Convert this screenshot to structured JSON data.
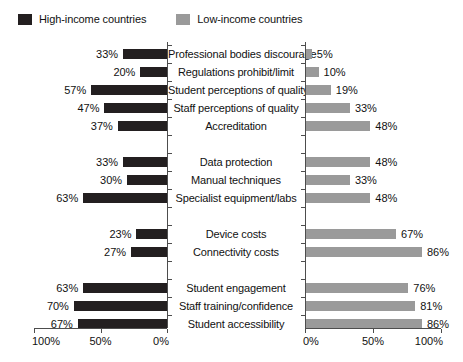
{
  "legend": {
    "entries": [
      {
        "label": "High-income countries",
        "color": "#231f20",
        "swatch_name": "legend-swatch-high-income"
      },
      {
        "label": "Low-income countries",
        "color": "#9a9a9a",
        "swatch_name": "legend-swatch-low-income"
      }
    ]
  },
  "axes": {
    "left": {
      "ticks": [
        "100%",
        "50%",
        "0%"
      ],
      "tick_values": [
        100,
        50,
        0
      ],
      "range_max": 100
    },
    "right": {
      "ticks": [
        "0%",
        "50%",
        "100%"
      ],
      "tick_values": [
        0,
        50,
        100
      ],
      "range_max": 100
    }
  },
  "chart_data": {
    "type": "bar",
    "orientation": "horizontal-diverging",
    "title": "",
    "xlabel": "",
    "ylabel": "",
    "xlim": [
      0,
      100
    ],
    "grid": false,
    "legend_position": "top-left",
    "series": [
      {
        "name": "High-income countries",
        "color": "#231f20",
        "side": "left",
        "values": [
          33,
          20,
          57,
          47,
          37,
          33,
          30,
          63,
          23,
          27,
          63,
          70,
          67
        ],
        "labels": [
          "33%",
          "20%",
          "57%",
          "47%",
          "37%",
          "33%",
          "30%",
          "63%",
          "23%",
          "27%",
          "63%",
          "70%",
          "67%"
        ]
      },
      {
        "name": "Low-income countries",
        "color": "#9a9a9a",
        "side": "right",
        "values": [
          5,
          10,
          19,
          33,
          48,
          48,
          33,
          48,
          67,
          86,
          76,
          81,
          86
        ],
        "labels": [
          "5%",
          "10%",
          "19%",
          "33%",
          "48%",
          "48%",
          "33%",
          "48%",
          "67%",
          "86%",
          "76%",
          "81%",
          "86%"
        ]
      }
    ],
    "categories": [
      "Professional bodies discourage",
      "Regulations prohibit/limit",
      "Student perceptions of quality",
      "Staff perceptions of quality",
      "Accreditation",
      "Data protection",
      "Manual techniques",
      "Specialist equipment/labs",
      "Device costs",
      "Connectivity costs",
      "Student engagement",
      "Staff training/confidence",
      "Student accessibility"
    ],
    "groups": [
      {
        "rows": [
          0,
          1,
          2,
          3,
          4
        ]
      },
      {
        "rows": [
          5,
          6,
          7
        ]
      },
      {
        "rows": [
          8,
          9
        ]
      },
      {
        "rows": [
          10,
          11,
          12
        ]
      }
    ]
  },
  "rows": [
    {
      "category": "Professional bodies discourage",
      "left_label": "33%",
      "left_value": 33,
      "right_label": "5%",
      "right_value": 5,
      "slot": 0
    },
    {
      "category": "Regulations prohibit/limit",
      "left_label": "20%",
      "left_value": 20,
      "right_label": "10%",
      "right_value": 10,
      "slot": 1
    },
    {
      "category": "Student perceptions of quality",
      "left_label": "57%",
      "left_value": 57,
      "right_label": "19%",
      "right_value": 19,
      "slot": 2
    },
    {
      "category": "Staff perceptions of quality",
      "left_label": "47%",
      "left_value": 47,
      "right_label": "33%",
      "right_value": 33,
      "slot": 3
    },
    {
      "category": "Accreditation",
      "left_label": "37%",
      "left_value": 37,
      "right_label": "48%",
      "right_value": 48,
      "slot": 4
    },
    {
      "category": "Data protection",
      "left_label": "33%",
      "left_value": 33,
      "right_label": "48%",
      "right_value": 48,
      "slot": 6
    },
    {
      "category": "Manual techniques",
      "left_label": "30%",
      "left_value": 30,
      "right_label": "33%",
      "right_value": 33,
      "slot": 7
    },
    {
      "category": "Specialist equipment/labs",
      "left_label": "63%",
      "left_value": 63,
      "right_label": "48%",
      "right_value": 48,
      "slot": 8
    },
    {
      "category": "Device costs",
      "left_label": "23%",
      "left_value": 23,
      "right_label": "67%",
      "right_value": 67,
      "slot": 10
    },
    {
      "category": "Connectivity costs",
      "left_label": "27%",
      "left_value": 27,
      "right_label": "86%",
      "right_value": 86,
      "slot": 11
    },
    {
      "category": "Student engagement",
      "left_label": "63%",
      "left_value": 63,
      "right_label": "76%",
      "right_value": 76,
      "slot": 13
    },
    {
      "category": "Staff training/confidence",
      "left_label": "70%",
      "left_value": 70,
      "right_label": "81%",
      "right_value": 81,
      "slot": 14
    },
    {
      "category": "Student accessibility",
      "left_label": "67%",
      "left_value": 67,
      "right_label": "86%",
      "right_value": 86,
      "slot": 15
    }
  ]
}
